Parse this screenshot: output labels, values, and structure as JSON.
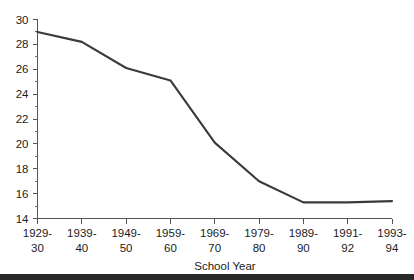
{
  "chart_data": {
    "type": "line",
    "title": "",
    "xlabel": "School Year",
    "ylabel": "",
    "categories": [
      "1929-30",
      "1939-40",
      "1949-50",
      "1959-60",
      "1969-70",
      "1979-80",
      "1989-90",
      "1991-92",
      "1993-94"
    ],
    "category_lines": [
      [
        "1929-",
        "30"
      ],
      [
        "1939-",
        "40"
      ],
      [
        "1949-",
        "50"
      ],
      [
        "1959-",
        "60"
      ],
      [
        "1969-",
        "70"
      ],
      [
        "1979-",
        "80"
      ],
      [
        "1989-",
        "90"
      ],
      [
        "1991-",
        "92"
      ],
      [
        "1993-",
        "94"
      ]
    ],
    "values": [
      29.0,
      28.2,
      26.1,
      25.1,
      20.1,
      17.0,
      15.3,
      15.3,
      15.4
    ],
    "ylim": [
      14,
      30
    ],
    "ytick_labels": [
      "14",
      "16",
      "18",
      "20",
      "22",
      "24",
      "26",
      "28",
      "30"
    ],
    "ytick_values": [
      14,
      16,
      18,
      20,
      22,
      24,
      26,
      28,
      30
    ],
    "yminor_values": [
      15,
      17,
      19,
      21,
      23,
      25,
      27,
      29
    ],
    "grid": false,
    "legend": false,
    "line_color": "#3a3a3a",
    "axis_color": "#545454",
    "text_color": "#1b1b1b",
    "background": "#ffffff",
    "footer_bar_color": "#2a2a2a"
  }
}
